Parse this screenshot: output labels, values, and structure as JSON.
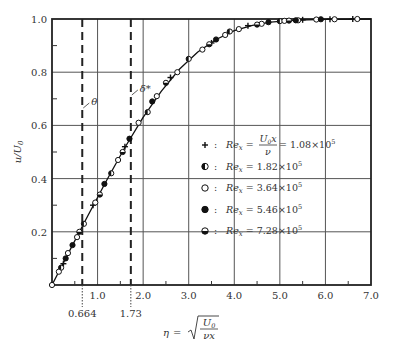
{
  "chart_data": {
    "type": "scatter",
    "title": "",
    "xlabel": "η = √(U0 / νx)",
    "ylabel": "u/U0",
    "xlim": [
      0,
      7.0
    ],
    "ylim": [
      0,
      1.0
    ],
    "grid": true,
    "xticks": [
      "1.0",
      "2.0",
      "3.0",
      "4.0",
      "5.0",
      "6.0",
      "7.0"
    ],
    "yticks": [
      "0.2",
      "0.4",
      "0.6",
      "0.8",
      "1.0"
    ],
    "vertical_markers": [
      {
        "x": 0.664,
        "label": "θ",
        "tick_label": "0.664"
      },
      {
        "x": 1.73,
        "label": "δ*",
        "tick_label": "1.73"
      }
    ],
    "curve": {
      "name": "Blasius solution",
      "x": [
        0,
        0.4,
        0.8,
        1.2,
        1.6,
        2.0,
        2.4,
        2.8,
        3.2,
        3.6,
        4.0,
        4.4,
        4.8,
        5.2,
        5.6,
        6.0,
        7.0
      ],
      "y": [
        0,
        0.133,
        0.265,
        0.394,
        0.517,
        0.63,
        0.729,
        0.812,
        0.876,
        0.923,
        0.956,
        0.976,
        0.988,
        0.994,
        0.997,
        0.999,
        1.0
      ]
    },
    "series": [
      {
        "name": "Re_x = U0x/ν = 1.08×10^5",
        "marker": "plus",
        "x": [
          0.25,
          0.9,
          1.6,
          2.6,
          3.5,
          4.3,
          5.5,
          6.1,
          6.6
        ],
        "y": [
          0.08,
          0.3,
          0.52,
          0.78,
          0.91,
          0.975,
          0.997,
          0.999,
          1.0
        ]
      },
      {
        "name": "Re_x = 1.82×10^5",
        "marker": "half-left",
        "x": [
          0.2,
          0.7,
          1.3,
          2.1,
          3.0,
          3.9,
          5.0
        ],
        "y": [
          0.065,
          0.23,
          0.42,
          0.65,
          0.85,
          0.953,
          0.992
        ]
      },
      {
        "name": "Re_x = 3.64×10^5",
        "marker": "open",
        "x": [
          0,
          0.15,
          0.35,
          0.55,
          0.95,
          1.45,
          1.9,
          2.3,
          2.75,
          3.3,
          3.8,
          4.1,
          4.6,
          5.1,
          5.4,
          5.8,
          6.2,
          6.7
        ],
        "y": [
          0,
          0.05,
          0.12,
          0.18,
          0.31,
          0.47,
          0.61,
          0.71,
          0.8,
          0.885,
          0.94,
          0.962,
          0.982,
          0.993,
          0.995,
          0.998,
          0.999,
          1.0
        ]
      },
      {
        "name": "Re_x = 5.46×10^5",
        "marker": "filled",
        "x": [
          0.3,
          0.45,
          1.15,
          1.7,
          2.2,
          3.6,
          4.75,
          5.35,
          5.9
        ],
        "y": [
          0.1,
          0.15,
          0.38,
          0.55,
          0.69,
          0.923,
          0.988,
          0.995,
          0.999
        ],
        "note": "approx."
      },
      {
        "name": "Re_x = 7.28×10^5",
        "marker": "half-bottom",
        "x": [
          0.6,
          1.05,
          1.55,
          2.5,
          3.45,
          4.5,
          5.2
        ],
        "y": [
          0.2,
          0.34,
          0.5,
          0.76,
          0.905,
          0.979,
          0.994
        ]
      }
    ]
  },
  "axes": {
    "ylabel": "u/U",
    "ylabel_sub": "0",
    "eta_symbol": "η",
    "eta_num": "U",
    "eta_num_sub": "0",
    "eta_den": "νx",
    "theta_label": "θ",
    "delta_label": "δ*",
    "theta_value": "0.664",
    "delta_value": "1.73"
  },
  "legend": {
    "items": [
      {
        "marker": "plus",
        "prefix": "Re",
        "sub": "x",
        "mid": " = ",
        "frac_num": "U",
        "frac_num_sub": "0",
        "frac_num_tail": "x",
        "frac_den": "ν",
        "value": " = 1.08×10",
        "exp": "5"
      },
      {
        "marker": "half-left",
        "prefix": "Re",
        "sub": "x",
        "value": " = 1.82×10",
        "exp": "5"
      },
      {
        "marker": "open",
        "prefix": "Re",
        "sub": "x",
        "value": " = 3.64×10",
        "exp": "5"
      },
      {
        "marker": "filled",
        "prefix": "Re",
        "sub": "x",
        "value": " = 5.46×10",
        "exp": "5"
      },
      {
        "marker": "half-bottom",
        "prefix": "Re",
        "sub": "x",
        "value": " = 7.28×10",
        "exp": "5"
      }
    ],
    "colon": ":"
  }
}
